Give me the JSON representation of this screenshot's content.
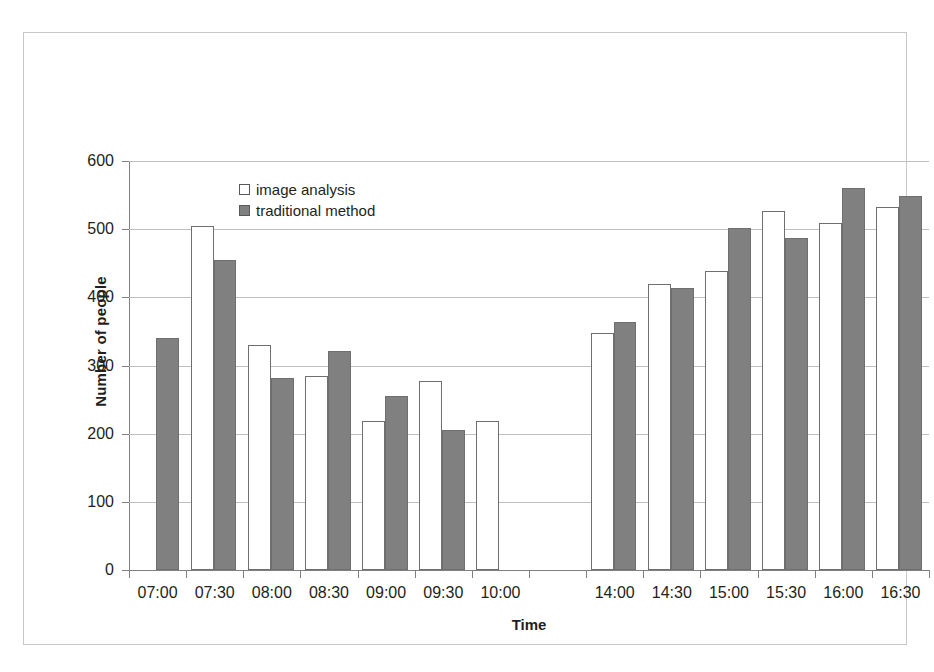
{
  "chart_data": {
    "type": "bar",
    "title": "",
    "xlabel": "Time",
    "ylabel": "Number of people",
    "ylim": [
      0,
      600
    ],
    "ytick_step": 100,
    "yticks": [
      0,
      100,
      200,
      300,
      400,
      500,
      600
    ],
    "grid": true,
    "legend_position": "inside-top-left",
    "categories": [
      "07:00",
      "07:30",
      "08:00",
      "08:30",
      "09:00",
      "09:30",
      "10:00",
      "",
      "14:00",
      "14:30",
      "15:00",
      "15:30",
      "16:00",
      "16:30"
    ],
    "series": [
      {
        "name": "image analysis",
        "color": "#ffffff",
        "values": [
          null,
          505,
          330,
          285,
          218,
          278,
          218,
          null,
          347,
          419,
          438,
          527,
          509,
          533
        ]
      },
      {
        "name": "traditional method",
        "color": "#808080",
        "values": [
          341,
          455,
          281,
          322,
          256,
          206,
          null,
          null,
          364,
          414,
          502,
          487,
          560,
          548
        ]
      }
    ]
  },
  "axes": {
    "y_title": "Number of people",
    "x_title": "Time",
    "y_tick_labels": [
      "600",
      "500",
      "400",
      "300",
      "200",
      "100",
      "0"
    ],
    "x_tick_labels": [
      "07:00",
      "07:30",
      "08:00",
      "08:30",
      "09:00",
      "09:30",
      "10:00",
      "",
      "14:00",
      "14:30",
      "15:00",
      "15:30",
      "16:00",
      "16:30"
    ]
  },
  "legend": {
    "items": [
      {
        "label": "image analysis",
        "swatch": "hollow-square-swatch"
      },
      {
        "label": "traditional method",
        "swatch": "filled-square-swatch"
      }
    ]
  },
  "colors": {
    "series_image_analysis": "#ffffff",
    "series_traditional_method": "#808080",
    "gridline": "#bfbfbf",
    "axis": "#808080",
    "text": "#231f20",
    "frame": "#c8c8c8"
  }
}
